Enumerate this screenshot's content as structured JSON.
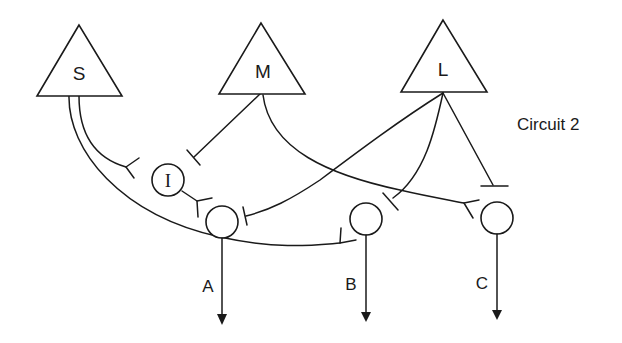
{
  "title": "Circuit 2",
  "colors": {
    "stroke": "#1a1a1a",
    "background": "#ffffff"
  },
  "input_neurons": [
    {
      "id": "S",
      "label": "S",
      "shape": "triangle"
    },
    {
      "id": "M",
      "label": "M",
      "shape": "triangle"
    },
    {
      "id": "L",
      "label": "L",
      "shape": "triangle"
    }
  ],
  "interneuron": {
    "id": "I",
    "label": "I",
    "shape": "circle"
  },
  "output_neurons": [
    {
      "id": "A",
      "label": "A",
      "shape": "circle"
    },
    {
      "id": "B",
      "label": "B",
      "shape": "circle"
    },
    {
      "id": "C",
      "label": "C",
      "shape": "circle"
    }
  ],
  "connections": [
    {
      "from": "S",
      "to": "I",
      "synapse": "excitatory-fork"
    },
    {
      "from": "S",
      "to": "B",
      "synapse": "excitatory-fork"
    },
    {
      "from": "M",
      "to": "I",
      "synapse": "inhibitory-bar"
    },
    {
      "from": "M",
      "to": "C",
      "synapse": "excitatory-fork"
    },
    {
      "from": "L",
      "to": "A",
      "synapse": "inhibitory-bar"
    },
    {
      "from": "L",
      "to": "B",
      "synapse": "inhibitory-bar"
    },
    {
      "from": "L",
      "to": "C",
      "synapse": "inhibitory-bar"
    },
    {
      "from": "I",
      "to": "A",
      "synapse": "excitatory-fork"
    }
  ]
}
